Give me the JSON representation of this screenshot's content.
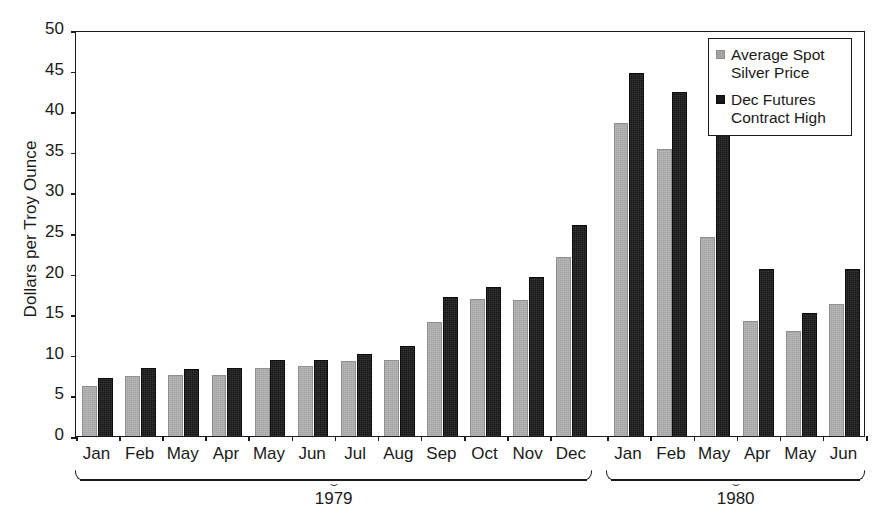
{
  "chart_data": {
    "type": "bar",
    "title": "",
    "xlabel": "",
    "ylabel": "Dollars per Troy Ounce",
    "ylim": [
      0,
      50
    ],
    "yticks": [
      0,
      5,
      10,
      15,
      20,
      25,
      30,
      35,
      40,
      45,
      50
    ],
    "ytick_labels": [
      "0",
      "5",
      "10",
      "15",
      "20",
      "25",
      "30",
      "35",
      "40",
      "45",
      "50"
    ],
    "grid": false,
    "legend_position": "top-right",
    "categories": [
      "Jan",
      "Feb",
      "May",
      "Apr",
      "May",
      "Jun",
      "Jul",
      "Aug",
      "Sep",
      "Oct",
      "Nov",
      "Dec",
      "Jan",
      "Feb",
      "May",
      "Apr",
      "May",
      "Jun"
    ],
    "series": [
      {
        "name": "Average Spot Silver Price",
        "color": "#a3a3a3",
        "values": [
          6.2,
          7.4,
          7.5,
          7.5,
          8.4,
          8.6,
          9.2,
          9.4,
          14.0,
          16.9,
          16.8,
          22.0,
          38.6,
          35.3,
          24.5,
          14.2,
          12.9,
          16.2
        ]
      },
      {
        "name": "Dec Futures Contract High",
        "color": "#171717",
        "values": [
          7.1,
          8.4,
          8.3,
          8.4,
          9.4,
          9.4,
          10.1,
          11.1,
          17.1,
          18.3,
          19.6,
          26.0,
          44.7,
          42.4,
          40.1,
          20.6,
          15.2,
          20.6
        ]
      }
    ],
    "groups": [
      {
        "label": "1979",
        "start_index": 0,
        "end_index": 11
      },
      {
        "label": "1980",
        "start_index": 12,
        "end_index": 17
      }
    ]
  },
  "legend": {
    "entries": [
      {
        "label_line1": "Average Spot",
        "label_line2": "Silver Price",
        "swatch": "gray-swatch"
      },
      {
        "label_line1": "Dec Futures",
        "label_line2": "Contract High",
        "swatch": "black-swatch"
      }
    ]
  }
}
